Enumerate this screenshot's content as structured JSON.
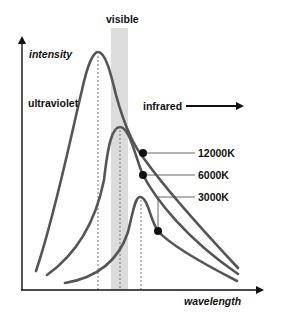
{
  "diagram": {
    "y_axis_label": "intensity",
    "x_axis_label": "wavelength",
    "region_labels": {
      "visible": "visible",
      "ultraviolet": "ultraviolet",
      "infrared": "infrared"
    },
    "curves": [
      {
        "label": "12000K",
        "color": "#555555"
      },
      {
        "label": "6000K",
        "color": "#555555"
      },
      {
        "label": "3000K",
        "color": "#555555"
      }
    ],
    "colors": {
      "curve": "#555555",
      "axis": "#111111",
      "visible_band": "#dcdcdc",
      "dashed_line": "#777777",
      "text": "#111111"
    }
  }
}
